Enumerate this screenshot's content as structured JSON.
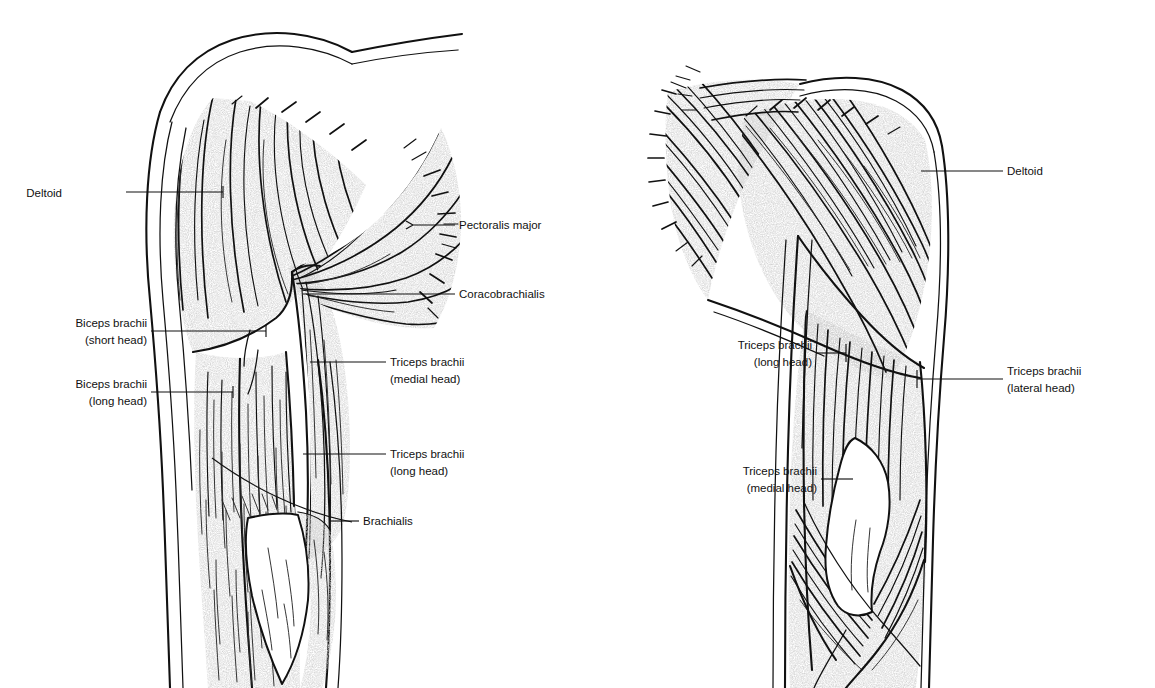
{
  "figure": {
    "views": [
      {
        "name": "anterior-view",
        "label": ""
      },
      {
        "name": "posterior-view",
        "label": ""
      }
    ]
  },
  "colors": {
    "ink": "#111111",
    "stipple": "#c8c8c8",
    "background": "#ffffff",
    "tendon": "#ffffff"
  },
  "left_figure": {
    "name": "anterior-arm",
    "labels": [
      {
        "id": "deltoid",
        "line1": "Deltoid",
        "line2": "",
        "side": "left",
        "text_x": 62,
        "text_y": 197,
        "lead": "M126,192 L223,192 M223,192 L223,186 M223,192 L223,198"
      },
      {
        "id": "biceps-short-head",
        "line1": "Biceps brachii",
        "line2": "(short head)",
        "side": "left",
        "text_x": 62,
        "text_y": 327,
        "lead": "M151,331 L266,331 M266,325 L266,337"
      },
      {
        "id": "biceps-long-head",
        "line1": "Biceps brachii",
        "line2": "(long head)",
        "side": "left",
        "text_x": 62,
        "text_y": 388,
        "lead": "M151,392 L233,392 M233,386 L233,398"
      },
      {
        "id": "pectoralis-major",
        "line1": "Pectoralis major",
        "line2": "",
        "side": "right",
        "text_x": 459,
        "text_y": 229,
        "lead": "M455,225 L415,225 M415,225 L409,222 M415,225 L409,228"
      },
      {
        "id": "coracobrachialis",
        "line1": "Coracobrachialis",
        "line2": "",
        "side": "right",
        "text_x": 459,
        "text_y": 298,
        "lead": "M455,294 L303,294"
      },
      {
        "id": "triceps-medial-head",
        "line1": "Triceps brachii",
        "line2": "(medial head)",
        "side": "right",
        "text_x": 390,
        "text_y": 366,
        "lead": "M386,362 L310,362"
      },
      {
        "id": "triceps-long-head",
        "line1": "Triceps brachii",
        "line2": "(long head)",
        "side": "right",
        "text_x": 390,
        "text_y": 458,
        "lead": "M386,454 L303,454"
      },
      {
        "id": "brachialis",
        "line1": "Brachialis",
        "line2": "",
        "side": "right",
        "text_x": 363,
        "text_y": 525,
        "lead": "M359,521 L283,521"
      }
    ]
  },
  "right_figure": {
    "name": "posterior-arm",
    "labels": [
      {
        "id": "deltoid-posterior",
        "line1": "Deltoid",
        "line2": "",
        "side": "right",
        "text_x": 1007,
        "text_y": 175,
        "lead": "M1003,171 L921,171"
      },
      {
        "id": "triceps-long-head-posterior",
        "line1": "Triceps brachii",
        "line2": "(long head)",
        "side": "left",
        "text_x": 684,
        "text_y": 349,
        "lead": "M846,353 L842,353 M846,347 L846,359"
      },
      {
        "id": "triceps-lateral-head",
        "line1": "Triceps brachii",
        "line2": "(lateral head)",
        "side": "right",
        "text_x": 1007,
        "text_y": 375,
        "lead": "M1003,379 L937,379 M937,373 L937,385"
      },
      {
        "id": "triceps-medial-head-posterior",
        "line1": "Triceps brachii",
        "line2": "(medial head)",
        "side": "left",
        "text_x": 693,
        "text_y": 475,
        "lead": "M853,479 L849,479"
      }
    ]
  }
}
